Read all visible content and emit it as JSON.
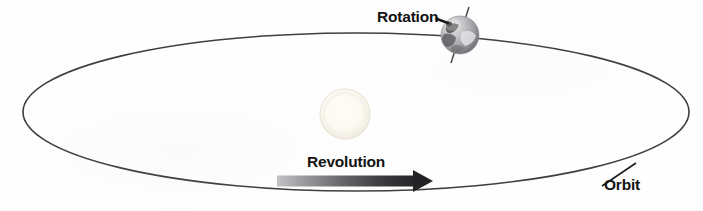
{
  "figure": {
    "background_color": "#fefefe"
  },
  "labels": {
    "rotation": "Rotation",
    "revolution": "Revolution",
    "orbit": "Orbit"
  },
  "colors": {
    "orbit_line": "#3f3f42",
    "label_text": "#131313",
    "arrow_light": "#b9b9bb",
    "arrow_dark": "#27272a",
    "sun_fill": "#fbf8ef",
    "sun_edge": "#e6e2d6",
    "earth_light": "#d2d2d4",
    "earth_mid": "#9a9a9d",
    "earth_dark": "#4f4f52",
    "earth_axis": "#4a4a4d"
  },
  "elements": {
    "orbit_ellipse": {
      "name": "orbit-ellipse",
      "center_x": 356,
      "center_y": 112,
      "radius_x": 333,
      "radius_y": 79,
      "stroke_width": 1.6
    },
    "sun": {
      "name": "sun",
      "center_x": 345,
      "center_y": 114,
      "radius": 25
    },
    "earth": {
      "name": "earth-globe",
      "center_x": 460,
      "center_y": 35,
      "radius": 19,
      "axis_tilt_degrees": 23.5
    },
    "revolution_arrow": {
      "name": "revolution-arrow",
      "x_start": 277,
      "x_end": 433,
      "y": 181,
      "thickness": 11,
      "direction": "right"
    },
    "rotation_pointer": {
      "name": "rotation-pointer",
      "x_start": 438,
      "y_start": 18,
      "x_end": 449,
      "y_end": 22
    },
    "orbit_leader_line": {
      "name": "orbit-leader-line",
      "x_start": 602,
      "y_start": 186,
      "x_end": 634,
      "y_end": 164
    }
  }
}
